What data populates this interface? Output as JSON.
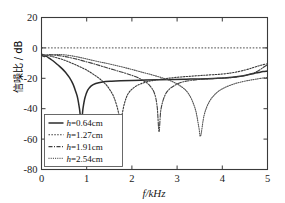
{
  "chart_data": {
    "type": "line",
    "title": "",
    "xlabel": "f/kHz",
    "ylabel": "信噪比 / dB",
    "xlim": [
      0,
      5
    ],
    "ylim": [
      -80,
      20
    ],
    "xticks": [
      0,
      1,
      2,
      3,
      4,
      5
    ],
    "yticks": [
      -80,
      -60,
      -40,
      -20,
      0,
      20
    ],
    "xtick_labels": [
      "0",
      "1",
      "2",
      "3",
      "4",
      "5"
    ],
    "ytick_labels": [
      "-80",
      "-60",
      "-40",
      "-20",
      "0",
      "20"
    ],
    "grid": false,
    "legend_position": "lower-left",
    "reference_lines": [
      {
        "name": "zero-db-line",
        "axis": "y",
        "value": 0,
        "style": "dotted"
      }
    ],
    "series": [
      {
        "name": "h=0.64cm",
        "label": "h=0.64cm",
        "h_cm": 0.64,
        "style": "solid",
        "color": "#2b2b2b",
        "null_frequency_khz": 0.88,
        "null_depth_db": -50,
        "x": [
          0.0,
          0.05,
          0.1,
          0.16,
          0.22,
          0.3,
          0.38,
          0.46,
          0.54,
          0.62,
          0.7,
          0.76,
          0.8,
          0.84,
          0.86,
          0.88,
          0.9,
          0.92,
          0.96,
          1.02,
          1.1,
          1.2,
          1.35,
          1.55,
          1.75,
          2.0,
          2.3,
          2.6,
          2.9,
          3.2,
          3.5,
          3.8,
          4.1,
          4.35,
          4.55,
          4.7,
          4.8,
          4.9,
          5.0
        ],
        "y": [
          -4.2,
          -5.6,
          -5.4,
          -6.6,
          -7.8,
          -9.6,
          -11.6,
          -13.8,
          -16.4,
          -19.6,
          -24.0,
          -29.0,
          -33.0,
          -40.0,
          -45.0,
          -50.0,
          -45.0,
          -39.5,
          -33.0,
          -28.0,
          -25.0,
          -23.4,
          -22.4,
          -21.9,
          -21.6,
          -21.4,
          -21.2,
          -21.0,
          -20.8,
          -20.6,
          -20.4,
          -20.1,
          -19.6,
          -18.8,
          -17.8,
          -16.8,
          -16.2,
          -15.6,
          -15.2
        ]
      },
      {
        "name": "h=1.27cm",
        "label": "h=1.27cm",
        "h_cm": 1.27,
        "style": "dotted",
        "color": "#3a3a3a",
        "null_frequency_khz": 1.75,
        "null_depth_db": -52,
        "x": [
          0.0,
          0.06,
          0.12,
          0.2,
          0.3,
          0.42,
          0.55,
          0.7,
          0.85,
          1.0,
          1.15,
          1.3,
          1.45,
          1.58,
          1.66,
          1.72,
          1.75,
          1.78,
          1.84,
          1.92,
          2.05,
          2.2,
          2.4,
          2.6,
          2.85,
          3.1,
          3.4,
          3.7,
          4.0,
          4.25,
          4.5,
          4.7,
          4.85,
          5.0
        ],
        "y": [
          -4.6,
          -5.2,
          -5.0,
          -5.4,
          -6.2,
          -7.2,
          -8.6,
          -10.4,
          -12.4,
          -14.6,
          -17.4,
          -20.6,
          -25.0,
          -31.0,
          -37.5,
          -45.0,
          -52.0,
          -44.5,
          -36.0,
          -30.0,
          -26.0,
          -23.6,
          -21.8,
          -20.8,
          -19.8,
          -19.1,
          -18.4,
          -17.8,
          -17.2,
          -16.2,
          -14.6,
          -12.8,
          -11.4,
          -10.4
        ]
      },
      {
        "name": "h=1.91cm",
        "label": "h=1.91cm",
        "h_cm": 1.91,
        "style": "dashdot",
        "color": "#3f3f3f",
        "null_frequency_khz": 2.6,
        "null_depth_db": -55,
        "x": [
          0.0,
          0.08,
          0.18,
          0.3,
          0.45,
          0.6,
          0.78,
          0.95,
          1.15,
          1.35,
          1.6,
          1.85,
          2.05,
          2.25,
          2.4,
          2.5,
          2.56,
          2.6,
          2.64,
          2.72,
          2.82,
          2.95,
          3.1,
          3.3,
          3.55,
          3.8,
          4.05,
          4.3,
          4.55,
          4.75,
          4.9,
          5.0
        ],
        "y": [
          -4.0,
          -4.6,
          -4.4,
          -4.8,
          -5.4,
          -6.2,
          -7.4,
          -8.8,
          -10.4,
          -12.2,
          -14.4,
          -16.6,
          -18.6,
          -21.4,
          -25.0,
          -30.0,
          -39.0,
          -55.0,
          -41.0,
          -32.0,
          -27.4,
          -24.6,
          -22.6,
          -21.4,
          -20.6,
          -20.2,
          -19.8,
          -19.2,
          -17.8,
          -15.8,
          -13.0,
          -11.0
        ]
      },
      {
        "name": "h=2.54cm",
        "label": "h=2.54cm",
        "h_cm": 2.54,
        "style": "densedot",
        "color": "#555555",
        "null_frequency_khz": 3.5,
        "null_depth_db": -58,
        "x": [
          0.0,
          0.1,
          0.22,
          0.36,
          0.52,
          0.7,
          0.9,
          1.1,
          1.35,
          1.6,
          1.9,
          2.2,
          2.5,
          2.8,
          3.05,
          3.25,
          3.4,
          3.48,
          3.52,
          3.6,
          3.72,
          3.88,
          4.05,
          4.25,
          4.45,
          4.62,
          4.78,
          4.9,
          5.0
        ],
        "y": [
          -5.6,
          -5.0,
          -4.6,
          -4.4,
          -4.6,
          -5.4,
          -6.6,
          -8.0,
          -9.6,
          -11.2,
          -13.4,
          -15.8,
          -18.2,
          -21.0,
          -24.6,
          -30.0,
          -40.0,
          -52.0,
          -58.0,
          -44.0,
          -35.0,
          -29.4,
          -26.2,
          -23.8,
          -22.2,
          -21.2,
          -20.4,
          -19.8,
          -19.4
        ]
      }
    ]
  },
  "legend": {
    "items": [
      {
        "label": "h=0.64cm"
      },
      {
        "label": "h=1.27cm"
      },
      {
        "label": "h=1.91cm"
      },
      {
        "label": "h=2.54cm"
      }
    ]
  }
}
